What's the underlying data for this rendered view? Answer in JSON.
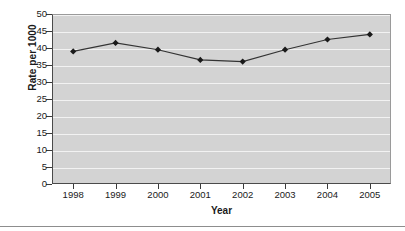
{
  "chart_data": {
    "type": "line",
    "title": "",
    "xlabel": "Year",
    "ylabel": "Rate per 1000",
    "categories": [
      "1998",
      "1999",
      "2000",
      "2001",
      "2002",
      "2003",
      "2004",
      "2005"
    ],
    "values": [
      39,
      41.5,
      39.5,
      36.5,
      36,
      39.5,
      42.5,
      44
    ],
    "series": [
      {
        "name": "Rate per 1000",
        "values": [
          39,
          41.5,
          39.5,
          36.5,
          36,
          39.5,
          42.5,
          44
        ]
      }
    ],
    "ylim": [
      0,
      50
    ],
    "yticks": [
      0,
      5,
      10,
      15,
      20,
      25,
      30,
      35,
      40,
      45,
      50
    ],
    "ytick_labels": [
      "0",
      "5",
      "10",
      "15",
      "20",
      "25",
      "30",
      "35",
      "40",
      "45",
      "50"
    ],
    "grid": "horizontal",
    "legend": "none",
    "marker": "diamond",
    "colors": {
      "line": "#333333",
      "marker": "#1a1a1a",
      "plot_background": "#d3d3d3",
      "gridline": "#f2f2f2",
      "axis": "#3a3a3a",
      "text": "#1a1a1a"
    }
  }
}
